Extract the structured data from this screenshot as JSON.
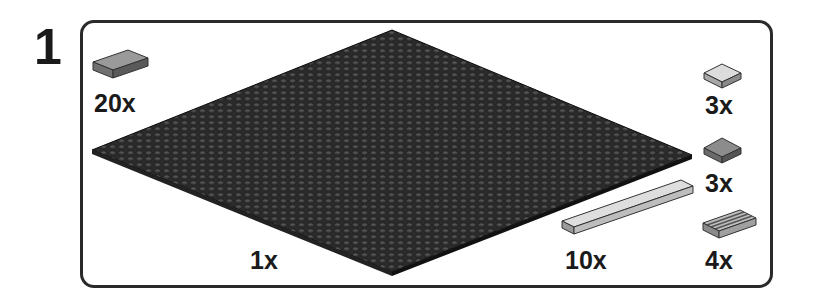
{
  "step": {
    "number": "1"
  },
  "parts": [
    {
      "id": "tile-1x2-dark-gray",
      "quantity": "20x",
      "color": "#8a8a8a"
    },
    {
      "id": "baseplate-48x48-black",
      "quantity": "1x",
      "color": "#2b2b2b"
    },
    {
      "id": "tile-2x2-light-gray",
      "quantity": "3x",
      "color": "#d6d6d6"
    },
    {
      "id": "tile-2x2-dark-gray",
      "quantity": "3x",
      "color": "#8c8c8c"
    },
    {
      "id": "tile-1x8-tan",
      "quantity": "10x",
      "color": "#dcdcdc"
    },
    {
      "id": "tile-grille-1x2",
      "quantity": "4x",
      "color": "#b5b5b5"
    }
  ],
  "colors": {
    "frame": "#2a2a2a",
    "text": "#1a1a1a",
    "baseplate": "#2b2b2b"
  }
}
